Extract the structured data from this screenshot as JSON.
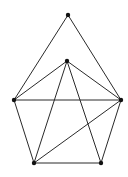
{
  "diagram": {
    "type": "undirected-graph",
    "colors": {
      "background": "#ffffff",
      "edge": "#2a2a2a",
      "node": "#111111"
    },
    "nodes": [
      {
        "id": "top",
        "x": 68,
        "y": 15
      },
      {
        "id": "center",
        "x": 67,
        "y": 61
      },
      {
        "id": "left",
        "x": 14,
        "y": 100
      },
      {
        "id": "right",
        "x": 121,
        "y": 100
      },
      {
        "id": "bottom-left",
        "x": 34,
        "y": 163
      },
      {
        "id": "bottom-right",
        "x": 101,
        "y": 163
      }
    ],
    "edges": [
      [
        "top",
        "left"
      ],
      [
        "top",
        "right"
      ],
      [
        "center",
        "left"
      ],
      [
        "center",
        "right"
      ],
      [
        "center",
        "bottom-left"
      ],
      [
        "center",
        "bottom-right"
      ],
      [
        "left",
        "right"
      ],
      [
        "left",
        "bottom-left"
      ],
      [
        "right",
        "bottom-right"
      ],
      [
        "right",
        "bottom-left"
      ],
      [
        "bottom-left",
        "bottom-right"
      ]
    ]
  }
}
